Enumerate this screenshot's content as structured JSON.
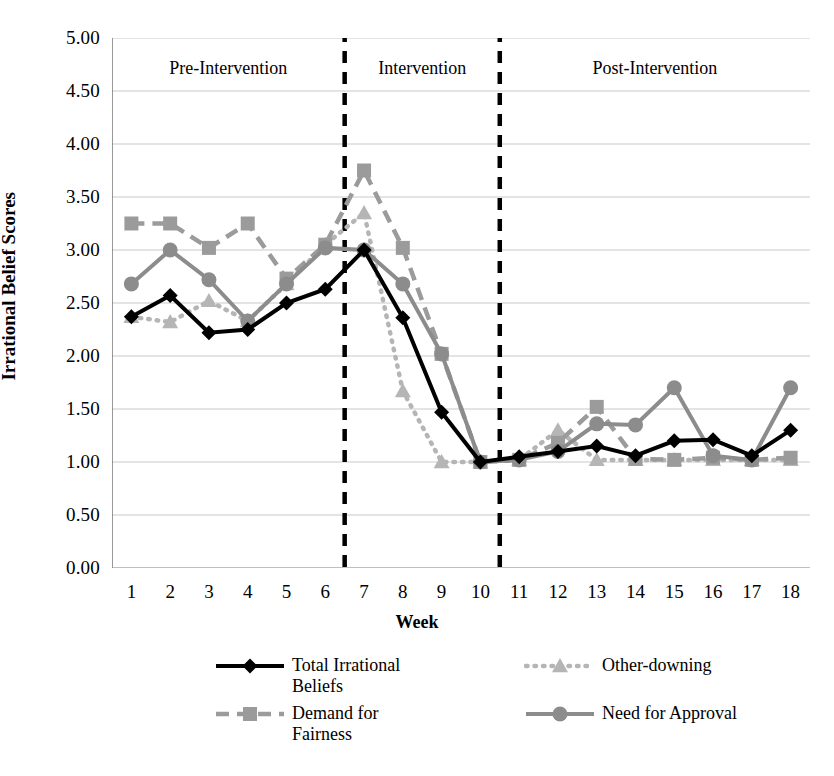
{
  "chart_data": {
    "type": "line",
    "title": "",
    "xlabel": "Week",
    "ylabel": "Irrational Belief Scores",
    "x": [
      1,
      2,
      3,
      4,
      5,
      6,
      7,
      8,
      9,
      10,
      11,
      12,
      13,
      14,
      15,
      16,
      17,
      18
    ],
    "xtick_labels": [
      "1",
      "2",
      "3",
      "4",
      "5",
      "6",
      "7",
      "8",
      "9",
      "10",
      "11",
      "12",
      "13",
      "14",
      "15",
      "16",
      "17",
      "18"
    ],
    "ytick_labels": [
      "0.00",
      "0.50",
      "1.00",
      "1.50",
      "2.00",
      "2.50",
      "3.00",
      "3.50",
      "4.00",
      "4.50",
      "5.00"
    ],
    "ytick_values": [
      0,
      0.5,
      1,
      1.5,
      2,
      2.5,
      3,
      3.5,
      4,
      4.5,
      5
    ],
    "ylim": [
      0,
      5
    ],
    "xlim": [
      0.5,
      18.5
    ],
    "grid": "horizontal",
    "legend_position": "bottom",
    "series": [
      {
        "name": "Total Irrational Beliefs",
        "color": "#000000",
        "line_style": "solid",
        "marker": "diamond",
        "values": [
          2.37,
          2.57,
          2.22,
          2.25,
          2.5,
          2.63,
          3.0,
          2.36,
          1.47,
          1.0,
          1.05,
          1.1,
          1.15,
          1.06,
          1.2,
          1.21,
          1.06,
          1.3
        ]
      },
      {
        "name": "Demand for Fairness",
        "color": "#9b9b9b",
        "line_style": "dashed",
        "marker": "square",
        "values": [
          3.25,
          3.25,
          3.02,
          3.25,
          2.73,
          3.05,
          3.75,
          3.02,
          2.02,
          1.0,
          1.02,
          1.18,
          1.52,
          1.03,
          1.02,
          1.04,
          1.02,
          1.04
        ]
      },
      {
        "name": "Other-downing",
        "color": "#b5b5b5",
        "line_style": "dotted",
        "marker": "triangle",
        "values": [
          2.37,
          2.32,
          2.52,
          2.33,
          2.68,
          3.05,
          3.35,
          1.67,
          1.0,
          1.0,
          1.02,
          1.3,
          1.02,
          1.02,
          1.02,
          1.02,
          1.02,
          1.02
        ]
      },
      {
        "name": "Need for Approval",
        "color": "#8c8c8c",
        "line_style": "solid",
        "marker": "circle",
        "values": [
          2.68,
          3.0,
          2.72,
          2.33,
          2.68,
          3.02,
          3.0,
          2.68,
          2.02,
          1.0,
          1.02,
          1.1,
          1.36,
          1.35,
          1.7,
          1.06,
          1.02,
          1.7
        ]
      }
    ],
    "phase_dividers": [
      6.5,
      10.5
    ],
    "annotations": [
      {
        "label": "Pre-Intervention",
        "center_week": 3.5
      },
      {
        "label": "Intervention",
        "center_week": 8.5
      },
      {
        "label": "Post-Intervention",
        "center_week": 14.5
      }
    ]
  },
  "legend": {
    "items": [
      {
        "label": "Total Irrational Beliefs"
      },
      {
        "label": "Other-downing"
      },
      {
        "label": "Demand for Fairness"
      },
      {
        "label": "Need for Approval"
      }
    ]
  }
}
